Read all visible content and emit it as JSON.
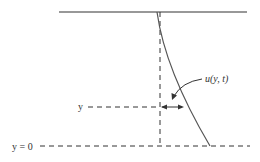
{
  "diagram": {
    "labels": {
      "velocity": "u(y, t)",
      "y_level": "y",
      "wall": "y = 0"
    },
    "colors": {
      "line": "#333333",
      "background": "#ffffff"
    }
  }
}
